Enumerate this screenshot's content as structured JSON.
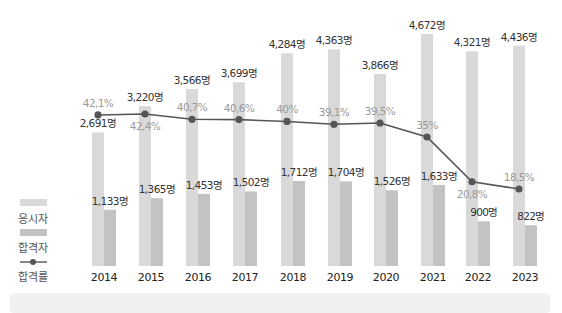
{
  "chart_data": {
    "type": "bar",
    "title": "",
    "xlabel": "",
    "ylabel": "",
    "categories": [
      "2014",
      "2015",
      "2016",
      "2017",
      "2018",
      "2019",
      "2020",
      "2021",
      "2022",
      "2023"
    ],
    "series": [
      {
        "name": "응시자",
        "type": "bar",
        "color": "#d9d9d9",
        "values": [
          2691,
          3220,
          3566,
          3699,
          4284,
          4363,
          3866,
          4672,
          4321,
          4436
        ],
        "labels": [
          "2,691명",
          "3,220명",
          "3,566명",
          "3,699명",
          "4,284명",
          "4,363명",
          "3,866명",
          "4,672명",
          "4,321명",
          "4,436명"
        ]
      },
      {
        "name": "합격자",
        "type": "bar",
        "color": "#c3c3c3",
        "values": [
          1133,
          1365,
          1453,
          1502,
          1712,
          1704,
          1526,
          1633,
          900,
          822
        ],
        "labels": [
          "1,133명",
          "1,365명",
          "1,453명",
          "1,502명",
          "1,712명",
          "1,704명",
          "1,526명",
          "1,633명",
          "900명",
          "822명"
        ]
      },
      {
        "name": "합격률",
        "type": "line",
        "color": "#555555",
        "unit": "%",
        "values": [
          42.1,
          42.4,
          40.7,
          40.6,
          40,
          39.1,
          39.5,
          35,
          20.8,
          18.5
        ],
        "labels": [
          "42,1%",
          "42,4%",
          "40,7%",
          "40,6%",
          "40%",
          "39,1%",
          "39,5%",
          "35%",
          "20,8%",
          "18,5%"
        ]
      }
    ],
    "legend": {
      "position": "left",
      "entries": [
        "응시자",
        "합격자",
        "합격률"
      ]
    },
    "grid": false,
    "ylim": [
      0,
      4700
    ]
  },
  "legend": {
    "applicants": "응시자",
    "passers": "합격자",
    "pass_rate": "합격률"
  }
}
